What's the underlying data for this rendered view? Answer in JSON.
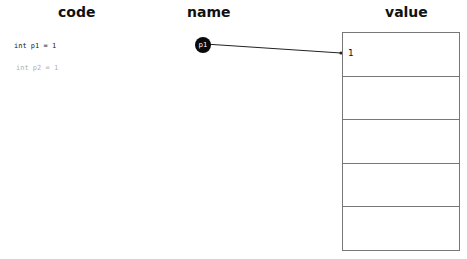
{
  "headings": {
    "code": "code",
    "name": "name",
    "value": "value"
  },
  "code_lines": [
    {
      "text": "int p1 = 1",
      "color": "#222222"
    },
    {
      "text": "int p2 = 1",
      "color": "#b0b0b0"
    }
  ],
  "names": [
    {
      "label": "p1",
      "points_to_cell": 0
    }
  ],
  "memory_cells": [
    {
      "value": "1"
    },
    {
      "value": ""
    },
    {
      "value": ""
    },
    {
      "value": ""
    },
    {
      "value": ""
    }
  ]
}
